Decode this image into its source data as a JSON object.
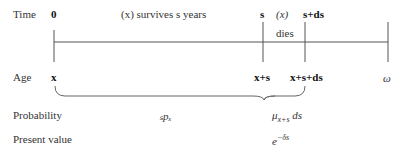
{
  "rows": {
    "time": "Time",
    "age": "Age",
    "probability": "Probability",
    "present_value": "Present value"
  },
  "time_labels": {
    "t0": "0",
    "event": "(x) survives s years",
    "ts": "s",
    "x_paren": "(x)",
    "dies": "dies",
    "tds": "s+ds"
  },
  "age_labels": {
    "a0": "x",
    "as": "x+s",
    "ads": "x+s+ds",
    "omega": "ω"
  },
  "probability": {
    "survival": "ₛpₓ",
    "force_main": "μ",
    "force_sub": "x+s",
    "force_ds": " ds"
  },
  "present_value": {
    "base": "e",
    "exponent": "−δs"
  }
}
